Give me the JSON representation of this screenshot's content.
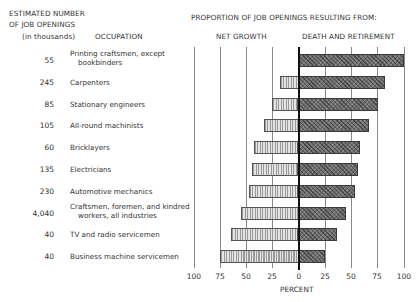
{
  "chart_data": {
    "type": "bar",
    "orientation": "horizontal-diverging",
    "title": "PROPORTION OF JOB OPENINGS RESULTING FROM:",
    "left_header": {
      "line1": "ESTIMATED NUMBER",
      "line2": "OF JOB OPENINGS",
      "line3": "(in thousands)",
      "occupation": "OCCUPATION"
    },
    "series": [
      {
        "name": "NET GROWTH",
        "direction": "left",
        "pattern": "light-vertical-stripes",
        "values": [
          0,
          18,
          25,
          33,
          42,
          44,
          47,
          55,
          64,
          75
        ]
      },
      {
        "name": "DEATH AND RETIREMENT",
        "direction": "right",
        "pattern": "dark-crosshatch",
        "values": [
          100,
          82,
          75,
          67,
          58,
          56,
          53,
          45,
          36,
          25
        ]
      }
    ],
    "rows": [
      {
        "openings": "55",
        "occupation": [
          "Printing craftsmen, except",
          "bookbinders"
        ],
        "net_growth": 0,
        "death_retirement": 100
      },
      {
        "openings": "245",
        "occupation": [
          "Carpenters"
        ],
        "net_growth": 18,
        "death_retirement": 82
      },
      {
        "openings": "85",
        "occupation": [
          "Stationary engineers"
        ],
        "net_growth": 25,
        "death_retirement": 75
      },
      {
        "openings": "105",
        "occupation": [
          "All-round machinists"
        ],
        "net_growth": 33,
        "death_retirement": 67
      },
      {
        "openings": "60",
        "occupation": [
          "Bricklayers"
        ],
        "net_growth": 42,
        "death_retirement": 58
      },
      {
        "openings": "135",
        "occupation": [
          "Electricians"
        ],
        "net_growth": 44,
        "death_retirement": 56
      },
      {
        "openings": "230",
        "occupation": [
          "Automotive mechanics"
        ],
        "net_growth": 47,
        "death_retirement": 53
      },
      {
        "openings": "4,040",
        "occupation": [
          "Craftsmen, foremen, and kindred",
          "workers, all industries"
        ],
        "net_growth": 55,
        "death_retirement": 45
      },
      {
        "openings": "40",
        "occupation": [
          "TV and radio servicemen"
        ],
        "net_growth": 64,
        "death_retirement": 36
      },
      {
        "openings": "40",
        "occupation": [
          "Business machine servicemen"
        ],
        "net_growth": 75,
        "death_retirement": 25
      }
    ],
    "xlabel": "PERCENT",
    "x_ticks": [
      "100",
      "75",
      "50",
      "25",
      "0",
      "25",
      "50",
      "75",
      "100"
    ],
    "xlim": [
      -100,
      100
    ],
    "grid": true,
    "legend": "column headers above plot"
  }
}
